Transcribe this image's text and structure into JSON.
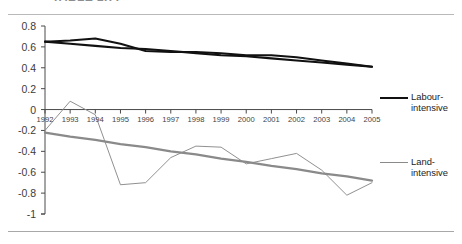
{
  "document": {
    "title_fragment": "TABLE 1.77",
    "rules": [
      "top-rule",
      "bottom-rule"
    ]
  },
  "legend": {
    "position": "right",
    "entries": [
      {
        "label_line1": "Labour-",
        "label_line2": "intensive",
        "color": "#111111",
        "width": 2.6
      },
      {
        "label_line1": "Land-",
        "label_line2": "intensive",
        "color": "#8a8a8a",
        "width": 1.5
      }
    ]
  },
  "axis": {
    "y_ticks": [
      "0.8",
      "0.6",
      "0.4",
      "0.2",
      "0",
      "-0.2",
      "-0.4",
      "-0.6",
      "-0.8",
      "-1"
    ],
    "x_ticks": [
      "1992",
      "1993",
      "1994",
      "1995",
      "1996",
      "1997",
      "1998",
      "1999",
      "2000",
      "2001",
      "2002",
      "2003",
      "2004",
      "2005"
    ]
  },
  "chart_data": {
    "type": "line",
    "title": "TABLE 1.77",
    "xlabel": "",
    "ylabel": "",
    "ylim": [
      -1,
      0.8
    ],
    "ytick_step": 0.2,
    "grid": false,
    "legend_position": "right",
    "categories": [
      "1992",
      "1993",
      "1994",
      "1995",
      "1996",
      "1997",
      "1998",
      "1999",
      "2000",
      "2001",
      "2002",
      "2003",
      "2004",
      "2005"
    ],
    "series": [
      {
        "name": "Labour-intensive",
        "color": "#111111",
        "values": [
          0.65,
          0.66,
          0.68,
          0.63,
          0.56,
          0.55,
          0.55,
          0.54,
          0.52,
          0.52,
          0.5,
          0.47,
          0.44,
          0.41
        ]
      },
      {
        "name": "Labour-intensive trend",
        "color": "#111111",
        "trendline": true,
        "values": [
          0.65,
          0.63,
          0.61,
          0.59,
          0.58,
          0.56,
          0.54,
          0.52,
          0.51,
          0.49,
          0.47,
          0.45,
          0.43,
          0.41
        ]
      },
      {
        "name": "Land-intensive",
        "color": "#8a8a8a",
        "values": [
          -0.2,
          0.08,
          -0.05,
          -0.72,
          -0.7,
          -0.46,
          -0.35,
          -0.36,
          -0.52,
          -0.47,
          -0.42,
          -0.58,
          -0.82,
          -0.7
        ]
      },
      {
        "name": "Land-intensive trend",
        "color": "#8a8a8a",
        "trendline": true,
        "values": [
          -0.22,
          -0.26,
          -0.29,
          -0.33,
          -0.36,
          -0.4,
          -0.43,
          -0.47,
          -0.5,
          -0.54,
          -0.57,
          -0.61,
          -0.64,
          -0.68
        ]
      }
    ]
  }
}
